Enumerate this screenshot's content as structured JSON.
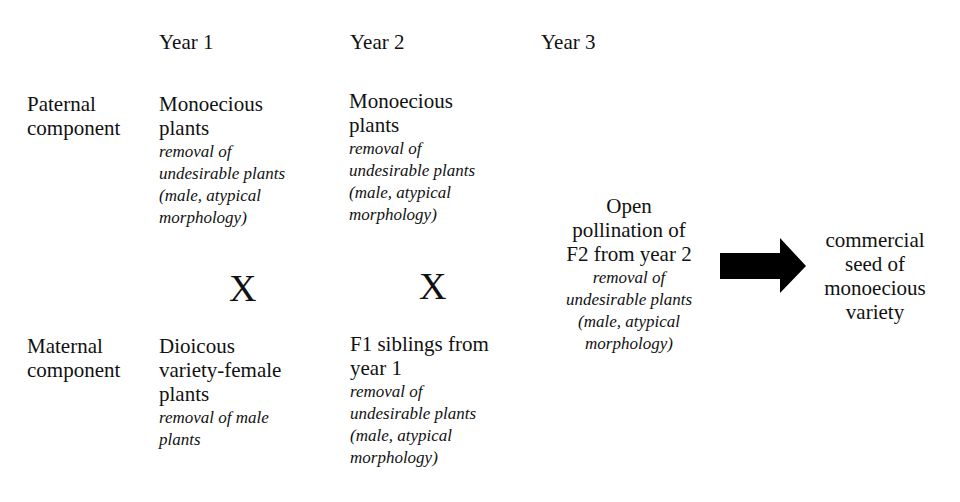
{
  "headers": {
    "year1": "Year 1",
    "year2": "Year 2",
    "year3": "Year 3"
  },
  "rows": {
    "paternal": [
      "Paternal",
      "component"
    ],
    "maternal": [
      "Maternal",
      "component"
    ]
  },
  "year1": {
    "paternal": {
      "title": [
        "Monoecious",
        "plants"
      ],
      "note": [
        "removal of",
        "undesirable plants",
        "(male, atypical",
        "morphology)"
      ]
    },
    "cross": "X",
    "maternal": {
      "title": [
        "Dioicous",
        "variety-female",
        "plants"
      ],
      "note": [
        "removal of male",
        "plants"
      ]
    }
  },
  "year2": {
    "paternal": {
      "title": [
        "Monoecious",
        "plants"
      ],
      "note": [
        "removal of",
        "undesirable plants",
        "(male, atypical",
        "morphology)"
      ]
    },
    "cross": "X",
    "maternal": {
      "title": [
        "F1 siblings from",
        "year 1"
      ],
      "note": [
        "removal of",
        "undesirable plants",
        "(male, atypical",
        "morphology)"
      ]
    }
  },
  "year3": {
    "title": [
      "Open",
      "pollination of",
      "F2 from year 2"
    ],
    "note": [
      "removal of",
      "undesirable plants",
      "(male, atypical",
      "morphology)"
    ]
  },
  "arrow": {
    "icon": "right-arrow-icon",
    "color": "#000000"
  },
  "result": [
    "commercial",
    "seed of",
    "monoecious",
    "variety"
  ]
}
